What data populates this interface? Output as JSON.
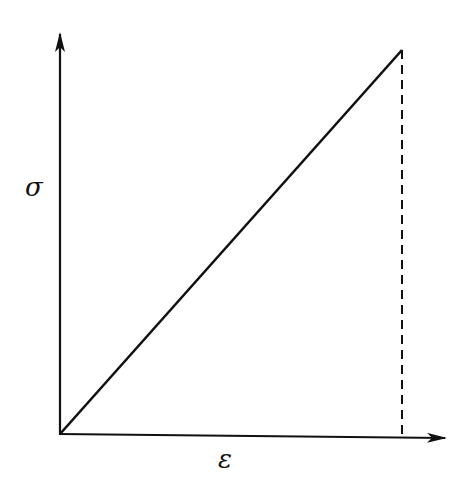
{
  "diagram": {
    "type": "stress-strain linear elastic",
    "y_axis_label": "σ",
    "x_axis_label": "ε",
    "line_color": "#111111",
    "background": "#ffffff",
    "elements": [
      {
        "name": "y-axis",
        "from": [
          60,
          434
        ],
        "to": [
          60,
          33
        ],
        "arrow": true
      },
      {
        "name": "x-axis",
        "from": [
          60,
          434
        ],
        "to": [
          446,
          438
        ],
        "arrow": true
      },
      {
        "name": "stress-strain-line",
        "from": [
          60,
          434
        ],
        "to": [
          402,
          50
        ]
      },
      {
        "name": "strain-drop-line",
        "from": [
          402,
          50
        ],
        "to": [
          402,
          438
        ],
        "style": "dashed"
      }
    ]
  }
}
